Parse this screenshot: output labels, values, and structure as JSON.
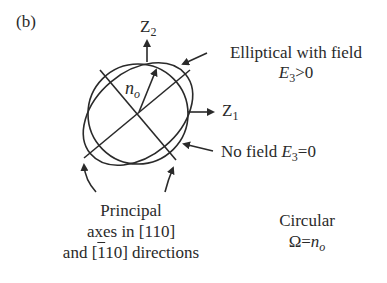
{
  "panel_label": "(b)",
  "axes": {
    "z2": {
      "base": "Z",
      "sub": "2"
    },
    "z1": {
      "base": "Z",
      "sub": "1"
    }
  },
  "radius_label": {
    "base": "n",
    "sub": "o"
  },
  "annotations": {
    "elliptical": {
      "line1": "Elliptical with field",
      "cond_base": "E",
      "cond_sub": "3",
      "cond_rest": ">0"
    },
    "no_field": {
      "text": "No field ",
      "cond_base": "E",
      "cond_sub": "3",
      "cond_rest": "=0"
    },
    "principal": {
      "line1": "Principal",
      "line2": "axes in [110]",
      "line3_pre": "and [",
      "line3_bar": "1",
      "line3_post": "10] directions"
    },
    "circular": {
      "line1": "Circular",
      "line2_pre": "Ω=",
      "line2_base": "n",
      "line2_sub": "o"
    }
  },
  "colors": {
    "stroke": "#2a2a2a",
    "background": "#ffffff"
  }
}
